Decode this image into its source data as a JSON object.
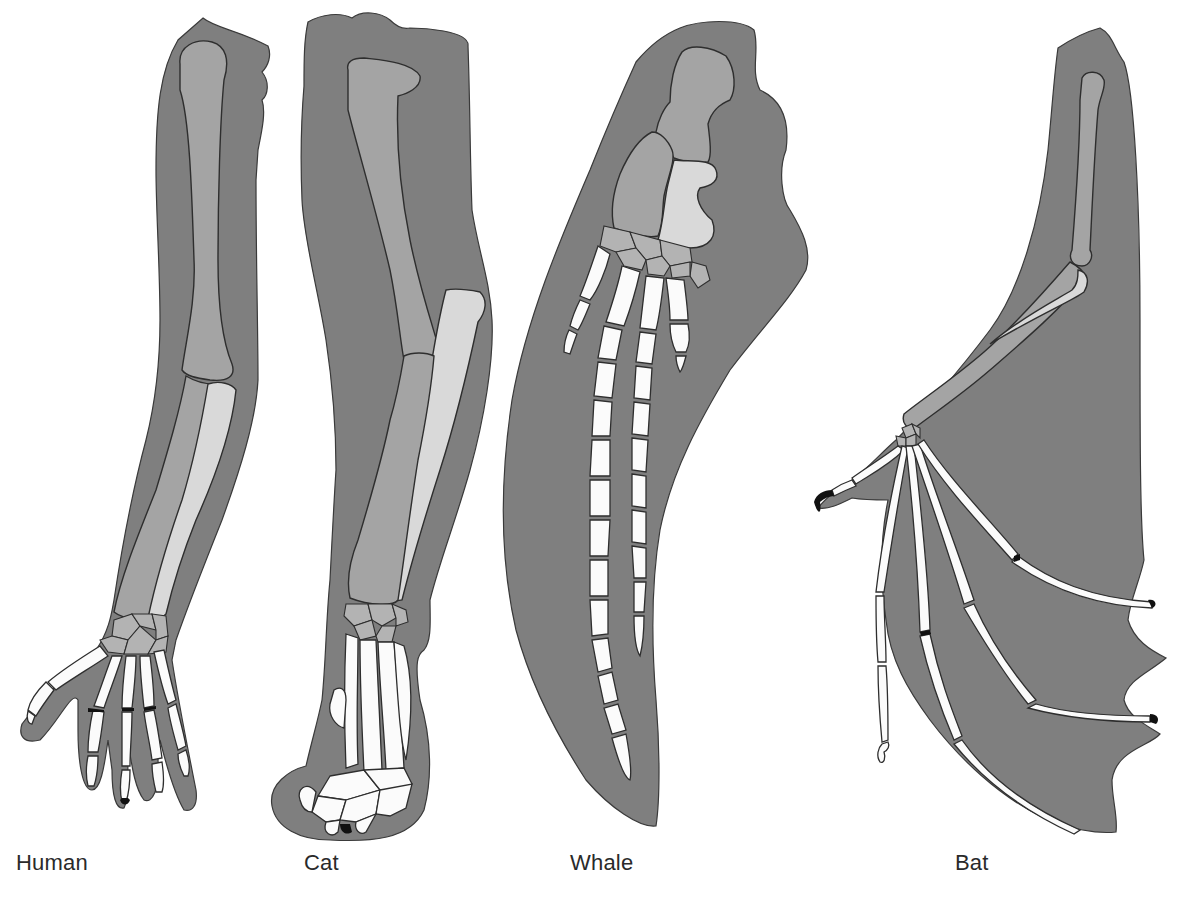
{
  "figure": {
    "type": "homologous-limb-comparison",
    "top_caption_fragment": "",
    "colors": {
      "background": "#ffffff",
      "skin": "#7f7f7f",
      "bone_upper": "#a4a4a4",
      "bone_lower_secondary": "#d9d9d9",
      "bone_digits": "#fbfbfb",
      "outline": "#2e2e2e",
      "label_text": "#2a2a2a"
    }
  },
  "labels": {
    "human": "Human",
    "cat": "Cat",
    "whale": "Whale",
    "bat": "Bat"
  },
  "limbs": [
    {
      "id": "human",
      "label": "Human",
      "parts": [
        "humerus",
        "radius",
        "ulna",
        "carpals",
        "metacarpals",
        "phalanges"
      ]
    },
    {
      "id": "cat",
      "label": "Cat",
      "parts": [
        "humerus",
        "radius",
        "ulna",
        "carpals",
        "metacarpals",
        "phalanges",
        "claws"
      ]
    },
    {
      "id": "whale",
      "label": "Whale",
      "parts": [
        "humerus",
        "radius",
        "ulna",
        "carpals",
        "metacarpals",
        "phalanges"
      ]
    },
    {
      "id": "bat",
      "label": "Bat",
      "parts": [
        "humerus",
        "radius",
        "ulna",
        "carpals",
        "metacarpals",
        "phalanges",
        "wing-membrane",
        "thumb-claw"
      ]
    }
  ]
}
